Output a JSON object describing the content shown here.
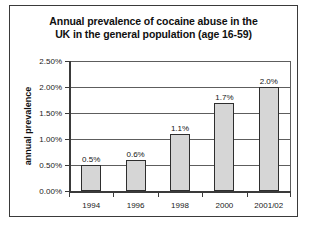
{
  "chart_data": {
    "type": "bar",
    "title": "Annual prevalence of cocaine abuse in the UK in the general population (age 16-59)",
    "title_line1": "Annual prevalence of cocaine abuse in the",
    "title_line2": "UK in the general population (age 16-59)",
    "xlabel": "",
    "ylabel": "annual prevalence",
    "categories": [
      "1994",
      "1996",
      "1998",
      "2000",
      "2001/02"
    ],
    "values": [
      0.5,
      0.6,
      1.1,
      1.7,
      2.0
    ],
    "value_labels": [
      "0.5%",
      "0.6%",
      "1.1%",
      "1.7%",
      "2.0%"
    ],
    "ylim": [
      0,
      2.5
    ],
    "ytick_values": [
      0,
      0.5,
      1.0,
      1.5,
      2.0,
      2.5
    ],
    "ytick_labels": [
      "0.00%",
      "0.50%",
      "1.00%",
      "1.50%",
      "2.00%",
      "2.50%"
    ],
    "grid": true,
    "legend": false,
    "bar_color": "#d6d6d6",
    "bar_border_color": "#2e2e2e",
    "axis_color": "#3a3a3a",
    "gridline_color": "#5d5d5d",
    "background": "#ffffff"
  }
}
